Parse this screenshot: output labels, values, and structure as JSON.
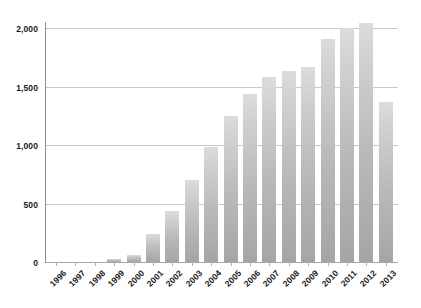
{
  "chart_data": {
    "type": "bar",
    "title": "",
    "subtitle": "",
    "xlabel": "",
    "ylabel": "",
    "ylim": [
      0,
      2000
    ],
    "grid": true,
    "legend": null,
    "categories": [
      "1996",
      "1997",
      "1998",
      "1999",
      "2000",
      "2001",
      "2002",
      "2003",
      "2004",
      "2005",
      "2006",
      "2007",
      "2008",
      "2009",
      "2010",
      "2011",
      "2012",
      "2013"
    ],
    "values": [
      2,
      4,
      8,
      25,
      62,
      240,
      440,
      700,
      985,
      1250,
      1435,
      1580,
      1635,
      1665,
      1910,
      2000,
      2040,
      1370
    ],
    "ytick_values": [
      0,
      500,
      1000,
      1500,
      2000
    ],
    "ytick_labels": [
      "0",
      "500",
      "1,000",
      "1,500",
      "2,000"
    ],
    "series": [
      {
        "name": "",
        "values": [
          2,
          4,
          8,
          25,
          62,
          240,
          440,
          700,
          985,
          1250,
          1435,
          1580,
          1635,
          1665,
          1910,
          2000,
          2040,
          1370
        ]
      }
    ],
    "colors": {
      "bar_top": "#dcdcdc",
      "bar_bottom": "#a5a5a5",
      "gridline": "#c9c9c9",
      "axis": "#8d8d8d",
      "text": "#1a1a1a",
      "background": "#ffffff"
    }
  }
}
